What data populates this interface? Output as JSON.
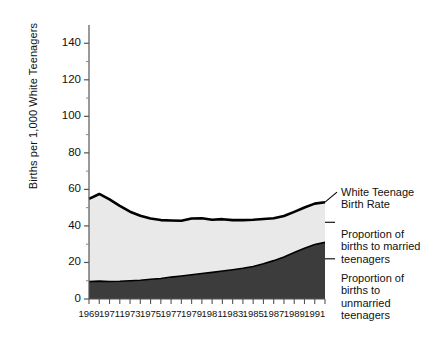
{
  "chart_data": {
    "type": "area",
    "title": "",
    "xlabel": "",
    "ylabel": "Births per 1,000 White Teenagers",
    "ylim": [
      0,
      150
    ],
    "xlim": [
      1969,
      1992
    ],
    "yticks": [
      0,
      20,
      40,
      60,
      80,
      100,
      120,
      140
    ],
    "ytick_labels": [
      "0",
      "20",
      "40",
      "60",
      "80",
      "100",
      "120",
      "140"
    ],
    "xticks": [
      1969,
      1971,
      1973,
      1975,
      1977,
      1979,
      1981,
      1983,
      1985,
      1987,
      1989,
      1991
    ],
    "xtick_labels": [
      "1969",
      "1971",
      "1973",
      "1975",
      "1977",
      "1979",
      "1981",
      "1983",
      "1985",
      "1987",
      "1989",
      "1991"
    ],
    "x": [
      1969,
      1970,
      1971,
      1972,
      1973,
      1974,
      1975,
      1976,
      1977,
      1978,
      1979,
      1980,
      1981,
      1982,
      1983,
      1984,
      1985,
      1986,
      1987,
      1988,
      1989,
      1990,
      1991,
      1992
    ],
    "grid": false,
    "legend_position": "right",
    "stacked": true,
    "series": [
      {
        "name": "Proportion of births to unmarried teenagers",
        "values": [
          9.5,
          9.8,
          9.6,
          9.7,
          10.0,
          10.3,
          10.8,
          11.2,
          12.0,
          12.6,
          13.3,
          14.0,
          14.6,
          15.3,
          16.0,
          16.8,
          17.8,
          19.3,
          21.0,
          23.0,
          25.5,
          27.8,
          29.8,
          31.0
        ],
        "color": "#3c3c3c"
      },
      {
        "name": "Proportion of births to married teenagers",
        "values": [
          45.3,
          47.7,
          44.9,
          41.3,
          37.8,
          35.3,
          33.3,
          32.0,
          31.0,
          30.2,
          30.8,
          30.2,
          28.8,
          28.4,
          27.2,
          26.4,
          25.6,
          24.5,
          23.2,
          22.4,
          22.2,
          22.3,
          22.4,
          22.0
        ],
        "color": "#e9e9e9"
      }
    ],
    "total_line": {
      "name": "White Teenage Birth Rate",
      "values": [
        54.8,
        57.5,
        54.5,
        51.0,
        47.8,
        45.6,
        44.1,
        43.2,
        43.0,
        42.8,
        44.1,
        44.2,
        43.4,
        43.7,
        43.2,
        43.2,
        43.4,
        43.8,
        44.2,
        45.4,
        47.7,
        50.1,
        52.2,
        53.0
      ],
      "color": "#000000"
    },
    "annotations": [
      {
        "label": "White Teenage Birth Rate",
        "target_year": 1992,
        "target_value": 53.0
      },
      {
        "label": "Proportion of births to married teenagers",
        "target_year": 1992,
        "target_value": 42.0
      },
      {
        "label": "Proportion of births to unmarried teenagers",
        "target_year": 1992,
        "target_value": 22.0
      }
    ]
  },
  "legend": {
    "items": [
      {
        "label": "White Teenage\nBirth Rate"
      },
      {
        "label": "Proportion of\nbirths to married\nteenagers"
      },
      {
        "label": "Proportion of\nbirths to\nunmarried\nteenagers"
      }
    ]
  }
}
